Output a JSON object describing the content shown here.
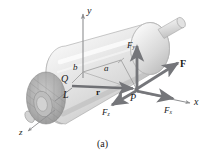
{
  "figure": {
    "caption": "(a)",
    "title": ""
  },
  "axes": {
    "x_label": "x",
    "y_label": "y",
    "z_label": "z"
  },
  "points": {
    "Q": "Q",
    "P": "P",
    "L": "L"
  },
  "dimensions": {
    "a": "a",
    "b": "b"
  },
  "vectors": {
    "r": "r",
    "F": "F",
    "Fx_base": "F",
    "Fx_sub": "x",
    "Fy_base": "F",
    "Fy_sub": "y",
    "Fz_base": "F",
    "Fz_sub": "z"
  },
  "colors": {
    "arrow_gray": "#7f8083",
    "arrow_dark": "#6a6b6e",
    "cylinder_light": "#ececec",
    "cylinder_mid": "#d6d6d6",
    "cylinder_dark": "#b5b5b5",
    "endface": "#a9a9a9",
    "axis_line": "#8e8f91",
    "text": "#1a1a1a",
    "background": "#ffffff"
  }
}
